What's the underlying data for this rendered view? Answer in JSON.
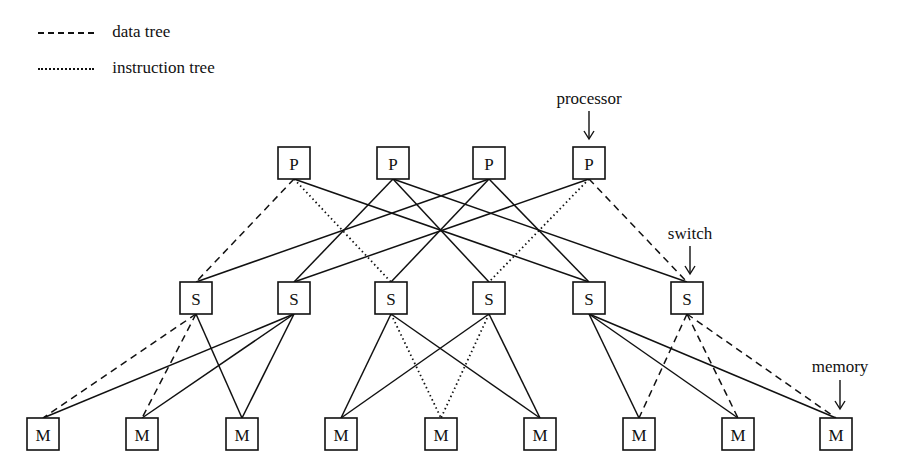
{
  "legend": {
    "items": [
      {
        "style": "dashed",
        "label": "data tree"
      },
      {
        "style": "dotted",
        "label": "instruction tree"
      }
    ]
  },
  "callouts": {
    "processor": "processor",
    "switch": "switch",
    "memory": "memory"
  },
  "nodes": {
    "processors": [
      {
        "id": "P1",
        "label": "P",
        "x": 294,
        "y": 163
      },
      {
        "id": "P2",
        "label": "P",
        "x": 393,
        "y": 163
      },
      {
        "id": "P3",
        "label": "P",
        "x": 489,
        "y": 163
      },
      {
        "id": "P4",
        "label": "P",
        "x": 589,
        "y": 163
      }
    ],
    "switches": [
      {
        "id": "S1",
        "label": "S",
        "x": 196,
        "y": 298
      },
      {
        "id": "S2",
        "label": "S",
        "x": 294,
        "y": 298
      },
      {
        "id": "S3",
        "label": "S",
        "x": 391,
        "y": 298
      },
      {
        "id": "S4",
        "label": "S",
        "x": 489,
        "y": 298
      },
      {
        "id": "S5",
        "label": "S",
        "x": 589,
        "y": 298
      },
      {
        "id": "S6",
        "label": "S",
        "x": 687,
        "y": 298
      }
    ],
    "memories": [
      {
        "id": "M1",
        "label": "M",
        "x": 43,
        "y": 434
      },
      {
        "id": "M2",
        "label": "M",
        "x": 142,
        "y": 434
      },
      {
        "id": "M3",
        "label": "M",
        "x": 242,
        "y": 434
      },
      {
        "id": "M4",
        "label": "M",
        "x": 341,
        "y": 434
      },
      {
        "id": "M5",
        "label": "M",
        "x": 441,
        "y": 434
      },
      {
        "id": "M6",
        "label": "M",
        "x": 540,
        "y": 434
      },
      {
        "id": "M7",
        "label": "M",
        "x": 639,
        "y": 434
      },
      {
        "id": "M8",
        "label": "M",
        "x": 738,
        "y": 434
      },
      {
        "id": "M9",
        "label": "M",
        "x": 836,
        "y": 434
      }
    ]
  },
  "edges": [
    {
      "from": "P1",
      "to": "S1",
      "style": "dashed"
    },
    {
      "from": "P1",
      "to": "S3",
      "style": "dotted"
    },
    {
      "from": "P1",
      "to": "S5",
      "style": "solid"
    },
    {
      "from": "P2",
      "to": "S2",
      "style": "solid"
    },
    {
      "from": "P2",
      "to": "S4",
      "style": "solid"
    },
    {
      "from": "P2",
      "to": "S6",
      "style": "solid"
    },
    {
      "from": "P3",
      "to": "S1",
      "style": "solid"
    },
    {
      "from": "P3",
      "to": "S3",
      "style": "solid"
    },
    {
      "from": "P3",
      "to": "S5",
      "style": "solid"
    },
    {
      "from": "P4",
      "to": "S2",
      "style": "solid"
    },
    {
      "from": "P4",
      "to": "S4",
      "style": "dotted"
    },
    {
      "from": "P4",
      "to": "S6",
      "style": "dashed"
    },
    {
      "from": "S1",
      "to": "M1",
      "style": "dashed"
    },
    {
      "from": "S1",
      "to": "M2",
      "style": "dashed"
    },
    {
      "from": "S1",
      "to": "M3",
      "style": "solid"
    },
    {
      "from": "S2",
      "to": "M1",
      "style": "solid"
    },
    {
      "from": "S2",
      "to": "M2",
      "style": "solid"
    },
    {
      "from": "S2",
      "to": "M3",
      "style": "solid"
    },
    {
      "from": "S3",
      "to": "M4",
      "style": "solid"
    },
    {
      "from": "S3",
      "to": "M5",
      "style": "dotted"
    },
    {
      "from": "S3",
      "to": "M6",
      "style": "solid"
    },
    {
      "from": "S4",
      "to": "M4",
      "style": "solid"
    },
    {
      "from": "S4",
      "to": "M5",
      "style": "dotted"
    },
    {
      "from": "S4",
      "to": "M6",
      "style": "solid"
    },
    {
      "from": "S5",
      "to": "M7",
      "style": "solid"
    },
    {
      "from": "S5",
      "to": "M8",
      "style": "solid"
    },
    {
      "from": "S5",
      "to": "M9",
      "style": "solid"
    },
    {
      "from": "S6",
      "to": "M7",
      "style": "dashed"
    },
    {
      "from": "S6",
      "to": "M8",
      "style": "dashed"
    },
    {
      "from": "S6",
      "to": "M9",
      "style": "dashed"
    }
  ]
}
